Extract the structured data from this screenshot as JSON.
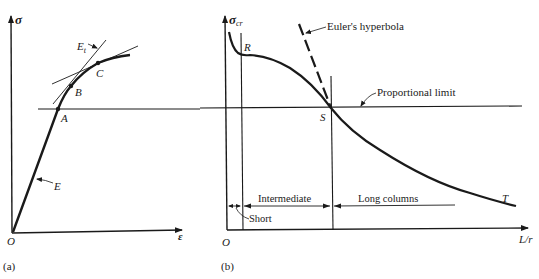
{
  "panel_a": {
    "caption": "(a)",
    "y_axis_label": "σ",
    "x_axis_label": "ε",
    "origin_label": "O",
    "points": [
      "A",
      "B",
      "C"
    ],
    "tangent_label": "E",
    "tangent_subscript": "t",
    "elastic_label": "E"
  },
  "panel_b": {
    "caption": "(b)",
    "y_axis_label": "σ",
    "y_axis_subscript": "cr",
    "x_axis_label": "L/r",
    "origin_label": "O",
    "points": [
      "R",
      "S",
      "T"
    ],
    "euler_label": "Euler's hyperbola",
    "proportional_limit_label": "Proportional limit",
    "regions": {
      "short": "Short",
      "intermediate": "Intermediate",
      "long": "Long columns"
    }
  },
  "colors": {
    "ink": "#1a1a1a",
    "background": "#ffffff"
  }
}
